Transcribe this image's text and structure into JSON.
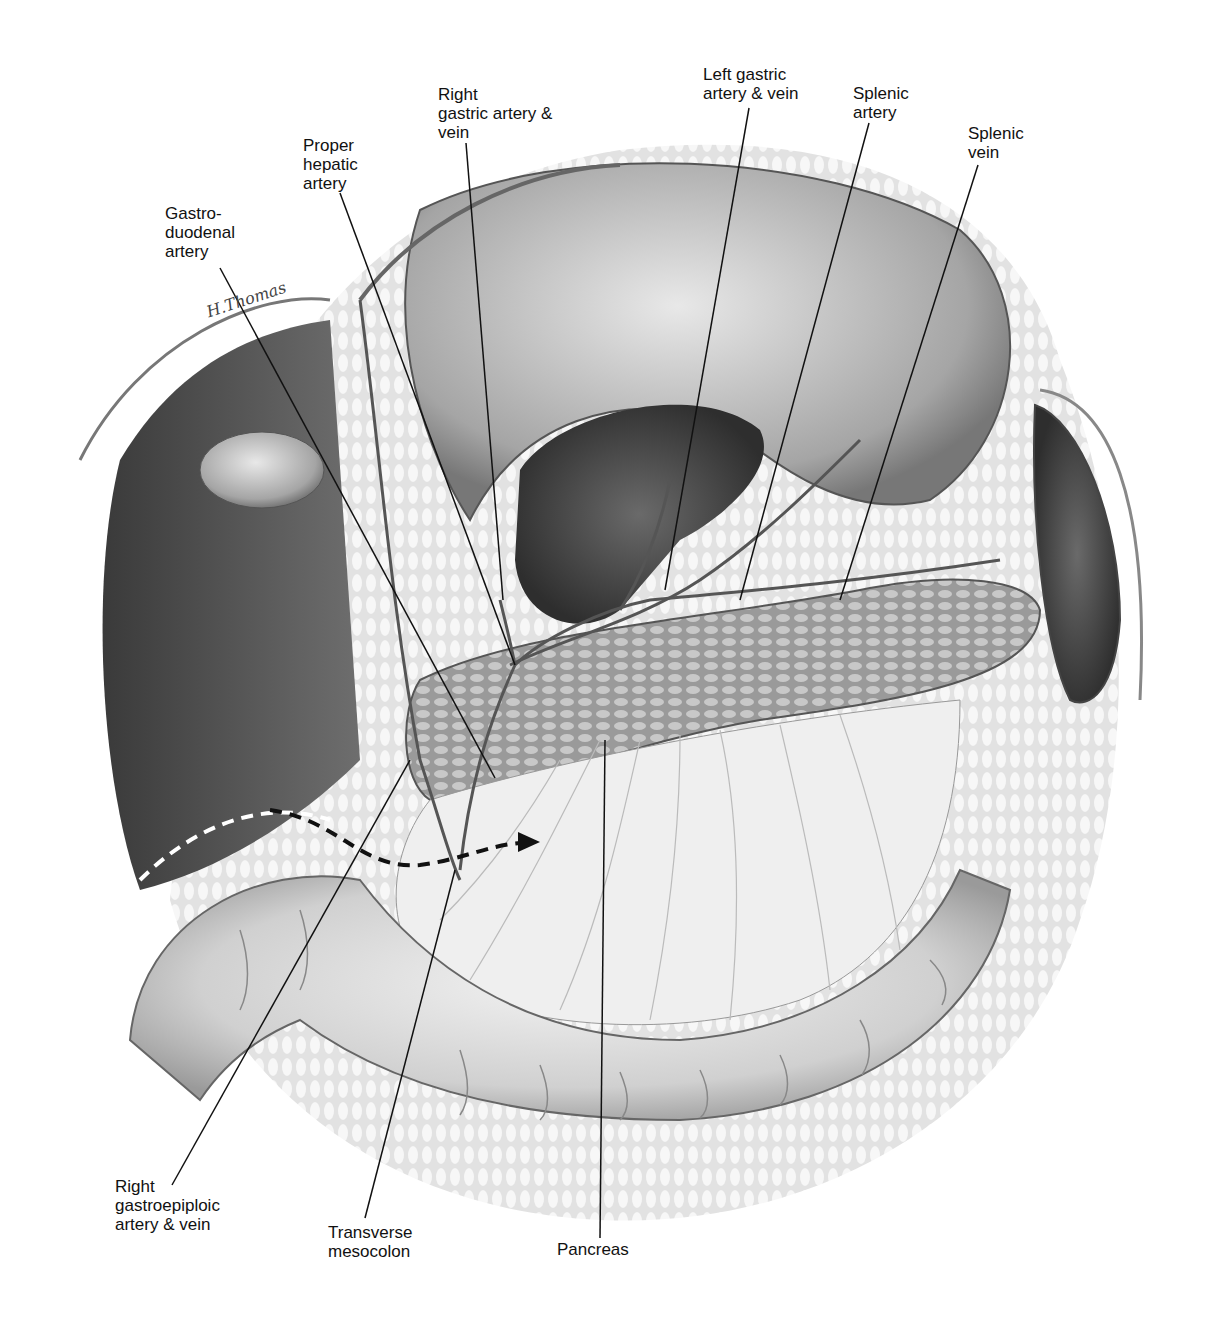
{
  "figure": {
    "type": "anatomical illustration",
    "signature": "H.Thomas",
    "arrow": "dashed-arrow"
  },
  "labels": [
    {
      "id": "gastroduodenal-artery",
      "lines": [
        "Gastro-",
        "duodenal",
        "artery"
      ],
      "x": 165,
      "y": 204,
      "line": [
        [
          220,
          268
        ],
        [
          495,
          778
        ]
      ]
    },
    {
      "id": "proper-hepatic-artery",
      "lines": [
        "Proper",
        "hepatic",
        "artery"
      ],
      "x": 303,
      "y": 136,
      "line": [
        [
          340,
          193
        ],
        [
          515,
          665
        ]
      ]
    },
    {
      "id": "right-gastric-artery-vein",
      "lines": [
        "Right",
        "gastric artery &",
        "vein"
      ],
      "x": 438,
      "y": 85,
      "line": [
        [
          466,
          143
        ],
        [
          503,
          600
        ]
      ]
    },
    {
      "id": "left-gastric-artery-vein",
      "lines": [
        "Left gastric",
        "artery & vein"
      ],
      "x": 703,
      "y": 65,
      "line": [
        [
          749,
          108
        ],
        [
          665,
          590
        ]
      ]
    },
    {
      "id": "splenic-artery",
      "lines": [
        "Splenic",
        "artery"
      ],
      "x": 853,
      "y": 84,
      "line": [
        [
          869,
          123
        ],
        [
          740,
          600
        ]
      ]
    },
    {
      "id": "splenic-vein",
      "lines": [
        "Splenic",
        "vein"
      ],
      "x": 968,
      "y": 124,
      "line": [
        [
          978,
          165
        ],
        [
          840,
          600
        ]
      ]
    },
    {
      "id": "right-gastroepiploic-artery-vein",
      "lines": [
        "Right",
        "gastroepiploic",
        "artery & vein"
      ],
      "x": 115,
      "y": 1177,
      "line": [
        [
          172,
          1185
        ],
        [
          410,
          760
        ]
      ]
    },
    {
      "id": "transverse-mesocolon",
      "lines": [
        "Transverse",
        "mesocolon"
      ],
      "x": 328,
      "y": 1223,
      "line": [
        [
          365,
          1218
        ],
        [
          455,
          870
        ]
      ]
    },
    {
      "id": "pancreas",
      "lines": [
        "Pancreas"
      ],
      "x": 557,
      "y": 1240,
      "line": [
        [
          600,
          1238
        ],
        [
          605,
          740
        ]
      ]
    }
  ]
}
